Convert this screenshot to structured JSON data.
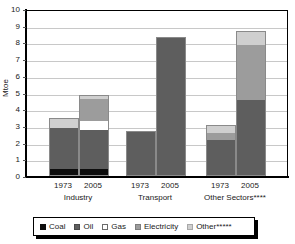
{
  "chart_data": {
    "type": "bar",
    "stacked": true,
    "title": "",
    "xlabel": "",
    "ylabel": "Mtoe",
    "ylim": [
      0,
      10
    ],
    "ytick_labels": [
      "0",
      "1",
      "2",
      "3",
      "4",
      "5",
      "6",
      "7",
      "8",
      "9",
      "10"
    ],
    "ytick_values": [
      0,
      1,
      2,
      3,
      4,
      5,
      6,
      7,
      8,
      9,
      10
    ],
    "grid": true,
    "legend_position": "bottom",
    "groups": [
      {
        "name": "Industry",
        "label": "Industry",
        "bars": [
          {
            "year": "1973",
            "total": 3.45,
            "segments": [
              {
                "series": "Coal",
                "value": 0.45
              },
              {
                "series": "Oil",
                "value": 2.4
              },
              {
                "series": "Gas",
                "value": 0
              },
              {
                "series": "Electricity",
                "value": 0
              },
              {
                "series": "Other",
                "value": 0.6
              }
            ]
          },
          {
            "year": "2005",
            "total": 4.85,
            "segments": [
              {
                "series": "Coal",
                "value": 0.42
              },
              {
                "series": "Oil",
                "value": 2.35
              },
              {
                "series": "Gas",
                "value": 0.55
              },
              {
                "series": "Electricity",
                "value": 1.28
              },
              {
                "series": "Other",
                "value": 0.25
              }
            ]
          }
        ]
      },
      {
        "name": "Transport",
        "label": "Transport",
        "bars": [
          {
            "year": "1973",
            "total": 2.7,
            "segments": [
              {
                "series": "Coal",
                "value": 0
              },
              {
                "series": "Oil",
                "value": 2.7
              },
              {
                "series": "Gas",
                "value": 0
              },
              {
                "series": "Electricity",
                "value": 0
              },
              {
                "series": "Other",
                "value": 0
              }
            ]
          },
          {
            "year": "2005",
            "total": 8.33,
            "segments": [
              {
                "series": "Coal",
                "value": 0
              },
              {
                "series": "Oil",
                "value": 8.33
              },
              {
                "series": "Gas",
                "value": 0
              },
              {
                "series": "Electricity",
                "value": 0
              },
              {
                "series": "Other",
                "value": 0
              }
            ]
          }
        ]
      },
      {
        "name": "Other Sectors",
        "label": "Other Sectors****",
        "bars": [
          {
            "year": "1973",
            "total": 3.05,
            "segments": [
              {
                "series": "Coal",
                "value": 0
              },
              {
                "series": "Oil",
                "value": 2.15
              },
              {
                "series": "Gas",
                "value": 0
              },
              {
                "series": "Electricity",
                "value": 0.45
              },
              {
                "series": "Other",
                "value": 0.45
              }
            ]
          },
          {
            "year": "2005",
            "total": 8.7,
            "segments": [
              {
                "series": "Coal",
                "value": 0
              },
              {
                "series": "Oil",
                "value": 4.55
              },
              {
                "series": "Gas",
                "value": 0
              },
              {
                "series": "Electricity",
                "value": 3.27
              },
              {
                "series": "Other",
                "value": 0.88
              }
            ]
          }
        ]
      }
    ],
    "series": [
      {
        "name": "Coal",
        "legend_label": "Coal",
        "color": "#0d0d0d"
      },
      {
        "name": "Oil",
        "legend_label": "Oil",
        "color": "#5e5e5e"
      },
      {
        "name": "Gas",
        "legend_label": "Gas",
        "color": "#ffffff"
      },
      {
        "name": "Electricity",
        "legend_label": "Electricity",
        "color": "#9c9c9c"
      },
      {
        "name": "Other",
        "legend_label": "Other*****",
        "color": "#cfcfcf"
      }
    ]
  },
  "legend": {
    "items": [
      {
        "label": "Coal",
        "key": "coal"
      },
      {
        "label": "Oil",
        "key": "oil"
      },
      {
        "label": "Gas",
        "key": "gas"
      },
      {
        "label": "Electricity",
        "key": "electricity"
      },
      {
        "label": "Other*****",
        "key": "other"
      }
    ]
  }
}
